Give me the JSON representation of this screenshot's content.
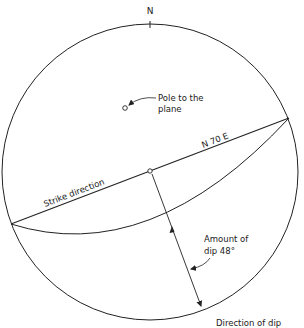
{
  "diagram": {
    "type": "stereonet",
    "north_label": "N",
    "strike_bearing_label": "N 70 E",
    "strike_label": "Strike direction",
    "pole_label_line1": "Pole to the",
    "pole_label_line2": "plane",
    "dip_amount_line1": "Amount of",
    "dip_amount_line2": "dip 48°",
    "dip_direction_label": "Direction of dip",
    "colors": {
      "stroke": "#222222",
      "background": "#ffffff"
    }
  }
}
